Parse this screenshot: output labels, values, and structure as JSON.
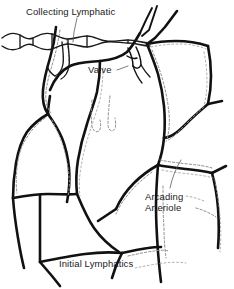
{
  "figure": {
    "background_color": "#ffffff",
    "ink_color": "#111111",
    "lymphatic_color": "#8d8d8d",
    "width": 234,
    "height": 289
  },
  "labels": {
    "collecting_lymphatic": "Collecting Lymphatic",
    "valve": "Valve",
    "arcading_arteriole_line1": "Arcading",
    "arcading_arteriole_line2": "Arteriole",
    "initial_lymphatics": "Initial Lymphatics"
  },
  "legend_structures": [
    {
      "name": "collecting-lymphatic",
      "style": "beaded chain of lobes",
      "location": "top-left horizontal vessel"
    },
    {
      "name": "valve",
      "style": "paired cusp lines within vessel",
      "location": "upper-center vessel junction"
    },
    {
      "name": "arcading-arteriole",
      "style": "bold continuous line network",
      "location": "polygonal arcades across field"
    },
    {
      "name": "initial-lymphatics",
      "style": "faint stippled blind-ended outlines",
      "location": "alongside arterioles"
    }
  ]
}
